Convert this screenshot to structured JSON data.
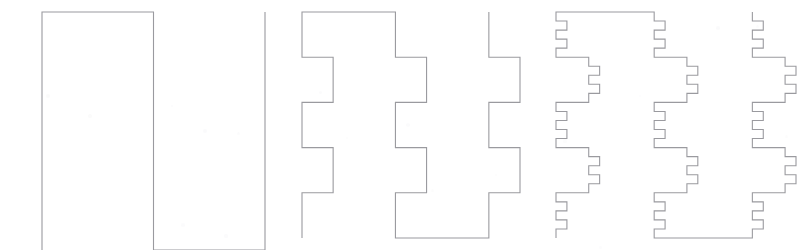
{
  "figure": {
    "canvas": {
      "width": 807,
      "height": 250
    },
    "background_color": "#ffffff",
    "stroke_color": "#9a9a9f",
    "stroke_width": 1.1,
    "panel_count": 3
  },
  "curve": {
    "type": "peano-zigzag",
    "generator": "up-right-down-right-up",
    "subdivision_factor": 3,
    "axiom_segments": 5,
    "orientation": "vertical-serpentine"
  },
  "panels": [
    {
      "name": "iteration-1",
      "label": "1",
      "order": 1,
      "x": 42,
      "y": 12,
      "width": 223,
      "height": 238,
      "cols": 3,
      "rows": 1,
      "segment_count": 5,
      "top_humps": 1,
      "bottom_humps": 1
    },
    {
      "name": "iteration-2",
      "label": "2",
      "order": 2,
      "x": 302,
      "y": 12,
      "width": 218,
      "height": 226,
      "cols": 9,
      "rows": 3,
      "segment_count": 41,
      "top_humps": 4,
      "bottom_humps": 4
    },
    {
      "name": "iteration-3",
      "label": "3",
      "order": 3,
      "x": 556,
      "y": 12,
      "width": 240,
      "height": 226,
      "cols": 27,
      "rows": 9,
      "segment_count": 365,
      "top_humps": 13,
      "bottom_humps": 13
    }
  ],
  "artifacts": {
    "note": "faint scanner speckles visible on the white page",
    "specks": [
      {
        "x": 48,
        "y": 96,
        "r": 2.0,
        "o": 0.3
      },
      {
        "x": 90,
        "y": 116,
        "r": 1.6,
        "o": 0.24
      },
      {
        "x": 172,
        "y": 106,
        "r": 1.4,
        "o": 0.2
      },
      {
        "x": 205,
        "y": 131,
        "r": 2.2,
        "o": 0.26
      },
      {
        "x": 238,
        "y": 133,
        "r": 1.5,
        "o": 0.22
      },
      {
        "x": 183,
        "y": 225,
        "r": 1.8,
        "o": 0.22
      },
      {
        "x": 226,
        "y": 236,
        "r": 1.6,
        "o": 0.2
      },
      {
        "x": 320,
        "y": 92,
        "r": 1.5,
        "o": 0.2
      },
      {
        "x": 347,
        "y": 138,
        "r": 1.4,
        "o": 0.18
      },
      {
        "x": 408,
        "y": 125,
        "r": 1.7,
        "o": 0.2
      },
      {
        "x": 432,
        "y": 190,
        "r": 1.5,
        "o": 0.18
      },
      {
        "x": 496,
        "y": 175,
        "r": 1.4,
        "o": 0.18
      },
      {
        "x": 718,
        "y": 28,
        "r": 1.8,
        "o": 0.26
      },
      {
        "x": 757,
        "y": 26,
        "r": 1.5,
        "o": 0.22
      },
      {
        "x": 640,
        "y": 96,
        "r": 1.4,
        "o": 0.16
      },
      {
        "x": 565,
        "y": 141,
        "r": 1.6,
        "o": 0.18
      },
      {
        "x": 786,
        "y": 136,
        "r": 1.5,
        "o": 0.18
      },
      {
        "x": 600,
        "y": 247,
        "r": 1.5,
        "o": 0.16
      }
    ]
  }
}
